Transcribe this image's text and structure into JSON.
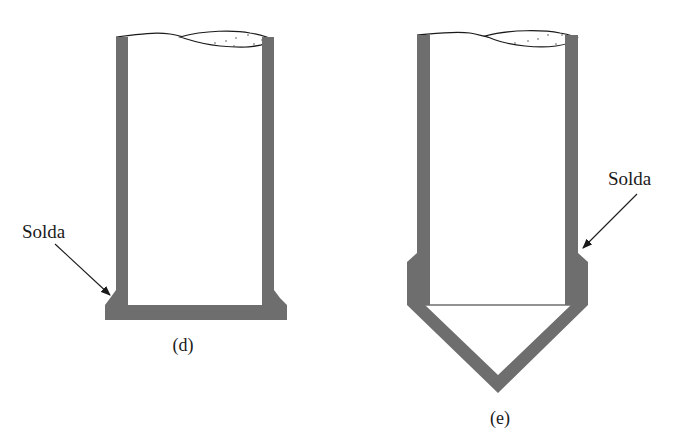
{
  "figure": {
    "colors": {
      "metal": "#6e6e6e",
      "line": "#1a1a1a",
      "background": "#ffffff"
    },
    "panels": [
      {
        "id": "d",
        "caption": "(d)",
        "callout_label": "Solda",
        "description": "Cylindrical vessel with flat bottom plate, fillet-welded at the base"
      },
      {
        "id": "e",
        "caption": "(e)",
        "callout_label": "Solda",
        "description": "Cylindrical vessel with conical bottom, welded at the transition"
      }
    ]
  }
}
